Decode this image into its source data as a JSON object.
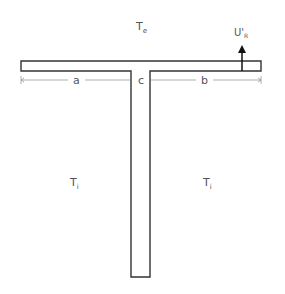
{
  "diagram": {
    "type": "T-section cross-section schematic",
    "labels": {
      "exterior_temp": {
        "main": "T",
        "sub": "e"
      },
      "interior_temp_left": {
        "main": "T",
        "sub": "i"
      },
      "interior_temp_right": {
        "main": "T",
        "sub": "i"
      },
      "heat_flux": {
        "main": "U'",
        "sub": "R"
      },
      "dim_a": "a",
      "dim_c": "c",
      "dim_b": "b"
    },
    "colors": {
      "stroke": "#333333",
      "dim_line": "#999999",
      "text": "#555555",
      "background": "#ffffff"
    }
  }
}
